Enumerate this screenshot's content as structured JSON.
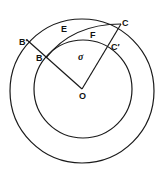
{
  "diagram": {
    "type": "geometry",
    "stroke_color": "#1a1a1a",
    "labels": {
      "B_prime": "B′",
      "B": "B",
      "E": "E",
      "F": "F",
      "C": "C",
      "C_prime": "C′",
      "sigma": "σ",
      "O": "O"
    }
  }
}
